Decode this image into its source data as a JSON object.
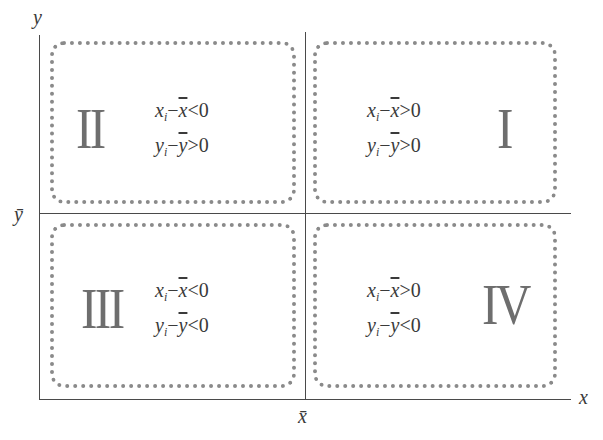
{
  "diagram": {
    "axes": {
      "x_label": "x",
      "y_label": "y",
      "x_mean_label": "x̄",
      "y_mean_label": "ȳ"
    },
    "quadrants": [
      {
        "id": "I",
        "numeral": "I",
        "x_cond": {
          "var": "x",
          "sub": "i",
          "mean": "x",
          "op": ">",
          "val": "0"
        },
        "y_cond": {
          "var": "y",
          "sub": "i",
          "mean": "y",
          "op": ">",
          "val": "0"
        }
      },
      {
        "id": "II",
        "numeral": "II",
        "x_cond": {
          "var": "x",
          "sub": "i",
          "mean": "x",
          "op": "<",
          "val": "0"
        },
        "y_cond": {
          "var": "y",
          "sub": "i",
          "mean": "y",
          "op": ">",
          "val": "0"
        }
      },
      {
        "id": "III",
        "numeral": "III",
        "x_cond": {
          "var": "x",
          "sub": "i",
          "mean": "x",
          "op": "<",
          "val": "0"
        },
        "y_cond": {
          "var": "y",
          "sub": "i",
          "mean": "y",
          "op": "<",
          "val": "0"
        }
      },
      {
        "id": "IV",
        "numeral": "IV",
        "x_cond": {
          "var": "x",
          "sub": "i",
          "mean": "x",
          "op": ">",
          "val": "0"
        },
        "y_cond": {
          "var": "y",
          "sub": "i",
          "mean": "y",
          "op": "<",
          "val": "0"
        }
      }
    ],
    "minus_sign": "−"
  }
}
